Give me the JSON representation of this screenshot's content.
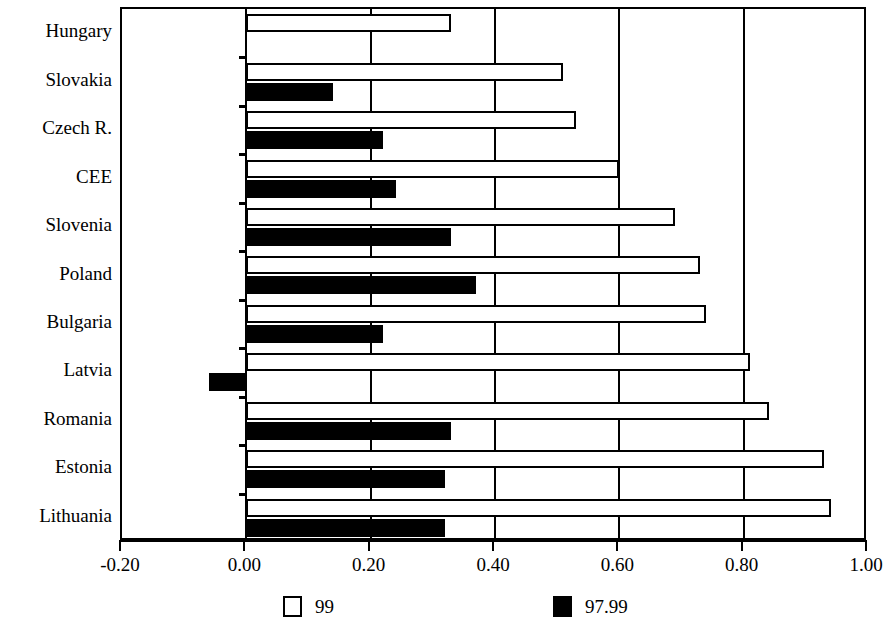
{
  "chart_data": {
    "type": "bar",
    "orientation": "horizontal",
    "title": "",
    "xlabel": "",
    "ylabel": "",
    "xlim": [
      -0.2,
      1.0
    ],
    "xticks": [
      -0.2,
      0.0,
      0.2,
      0.4,
      0.6,
      0.8,
      1.0
    ],
    "xtick_labels": [
      "-0.20",
      "0.00",
      "0.20",
      "0.40",
      "0.60",
      "0.80",
      "1.00"
    ],
    "grid": true,
    "grid_axis": "x",
    "legend_position": "bottom",
    "categories": [
      "Hungary",
      "Slovakia",
      "Czech R.",
      "CEE",
      "Slovenia",
      "Poland",
      "Bulgaria",
      "Latvia",
      "Romania",
      "Estonia",
      "Lithuania"
    ],
    "series": [
      {
        "name": "99",
        "color": "#ffffff",
        "edgecolor": "#000000",
        "values": [
          0.33,
          0.51,
          0.53,
          0.6,
          0.69,
          0.73,
          0.74,
          0.81,
          0.84,
          0.93,
          0.94
        ]
      },
      {
        "name": "97.99",
        "color": "#000000",
        "edgecolor": "#000000",
        "values": [
          0.0,
          0.14,
          0.22,
          0.24,
          0.33,
          0.37,
          0.22,
          -0.06,
          0.33,
          0.32,
          0.32
        ]
      }
    ]
  },
  "legend": {
    "items": [
      {
        "label": "99",
        "swatch": "white"
      },
      {
        "label": "97.99",
        "swatch": "black"
      }
    ]
  }
}
